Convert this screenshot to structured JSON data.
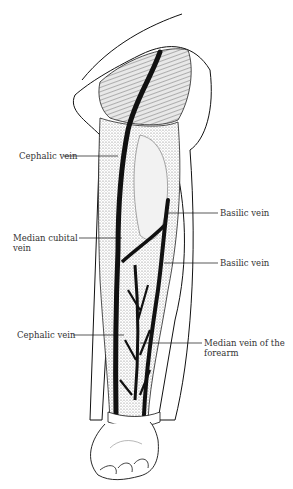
{
  "diagram": {
    "labels": [
      {
        "id": "cephalic-upper",
        "text": "Cephalic vein",
        "side": "left"
      },
      {
        "id": "median-cubital",
        "text": "Median cubital vein",
        "line1": "Median cubital",
        "line2": "vein",
        "side": "left"
      },
      {
        "id": "basilic-upper",
        "text": "Basilic vein",
        "side": "right"
      },
      {
        "id": "basilic-lower",
        "text": "Basilic vein",
        "side": "right"
      },
      {
        "id": "cephalic-lower",
        "text": "Cephalic vein",
        "side": "left"
      },
      {
        "id": "median-forearm",
        "text": "Median vein of the forearm",
        "line1": "Median vein of the",
        "line2": "forearm",
        "side": "right"
      }
    ],
    "colors": {
      "ink": "#111111",
      "stipple": "#9a9a9a",
      "background": "#ffffff"
    }
  }
}
